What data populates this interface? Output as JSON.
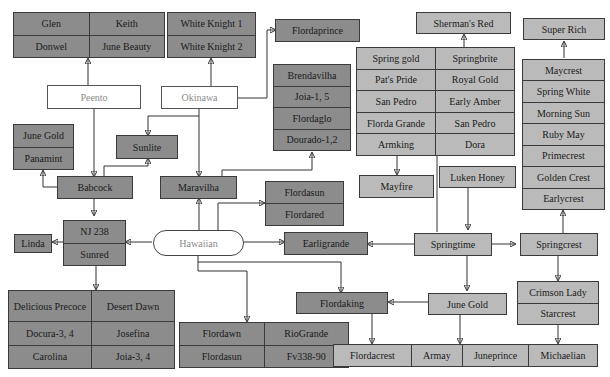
{
  "colors": {
    "dark_box": "#8c8c8c",
    "light_box": "#bababa",
    "origin_box": "#ffffff",
    "line": "#333333"
  },
  "nodes": {
    "glen_group": {
      "rows": [
        [
          "Glen",
          "Keith"
        ],
        [
          "Donwel",
          "June Beauty"
        ]
      ]
    },
    "white_knight_group": {
      "rows": [
        [
          "White Knight 1"
        ],
        [
          "White Knight 2"
        ]
      ]
    },
    "flordaprince": "Flordaprince",
    "peento": "Peento",
    "okinawa": "Okinawa",
    "brendavilha_group": {
      "rows": [
        [
          "Brendavilha"
        ],
        [
          "Joia-1, 5"
        ],
        [
          "Flordaglo"
        ],
        [
          "Dourado-1,2"
        ]
      ]
    },
    "june_gold_left_group": {
      "rows": [
        [
          "June Gold"
        ],
        [
          "Panamint"
        ]
      ]
    },
    "sunlite": "Sunlite",
    "babcock": "Babcock",
    "maravilha": "Maravilha",
    "flordasun_group": {
      "rows": [
        [
          "Flordasun"
        ],
        [
          "Flordared"
        ]
      ]
    },
    "nj238_group": {
      "rows": [
        [
          "NJ 238"
        ],
        [
          "Sunred"
        ]
      ]
    },
    "linda": "Linda",
    "hawaiian": "Hawaiian",
    "earligrande": "Earligrande",
    "delicious_group": {
      "rows": [
        [
          "Delicious Precoce",
          "Desert Dawn"
        ],
        [
          "Docura-3, 4",
          "Josefina"
        ],
        [
          "Carolina",
          "Joia-3, 4"
        ]
      ]
    },
    "flordawn_group": {
      "rows": [
        [
          "Flordawn",
          "RioGrande"
        ],
        [
          "Flordasun",
          "Fv338-90"
        ]
      ]
    },
    "shermans_red": "Sherman's Red",
    "super_rich": "Super Rich",
    "spring_gold_group": {
      "rows": [
        [
          "Spring gold",
          "Springbrite"
        ],
        [
          "Pat's Pride",
          "Royal Gold"
        ],
        [
          "San Pedro",
          "Early Amber"
        ],
        [
          "Florda Grande",
          "San Pedro"
        ],
        [
          "Armking",
          "Dora"
        ]
      ]
    },
    "maycrest_group": {
      "rows": [
        [
          "Maycrest"
        ],
        [
          "Spring White"
        ],
        [
          "Morning Sun"
        ],
        [
          "Ruby May"
        ],
        [
          "Primecrest"
        ],
        [
          "Golden Crest"
        ],
        [
          "Earlycrest"
        ]
      ]
    },
    "mayfire": "Mayfire",
    "luken_honey": "Luken Honey",
    "springtime": "Springtime",
    "springcrest": "Springcrest",
    "crimson_group": {
      "rows": [
        [
          "Crimson Lady"
        ],
        [
          "Starcrest"
        ]
      ]
    },
    "flordaking": "Flordaking",
    "june_gold": "June Gold",
    "bottom_group": {
      "rows": [
        [
          "Flordacrest",
          "Armay",
          "Juneprince",
          "Michaelian"
        ]
      ]
    }
  }
}
